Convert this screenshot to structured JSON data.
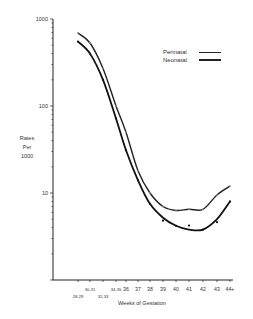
{
  "chart_data": {
    "type": "line",
    "title": "",
    "xlabel": "Weeks of Gestation",
    "ylabel": "Rates Per 1000",
    "yscale": "log",
    "ylim": [
      1,
      1000
    ],
    "yticks": [
      "1000",
      "100",
      "10"
    ],
    "categories": [
      "28-29",
      "30-31",
      "32-33",
      "34-35",
      "36",
      "37",
      "38",
      "39",
      "40",
      "41",
      "42",
      "43",
      "44+"
    ],
    "series": [
      {
        "name": "Perinatal",
        "values": [
          690,
          530,
          270,
          100,
          50,
          18,
          10,
          7,
          6.3,
          6.5,
          6.5,
          9.5,
          12
        ]
      },
      {
        "name": "Neonatal",
        "values": [
          550,
          400,
          200,
          72,
          31,
          14,
          7.5,
          5.2,
          4.2,
          3.8,
          3.8,
          5,
          8
        ]
      }
    ],
    "legend_position": "upper right",
    "grid": false
  },
  "legend": {
    "items": [
      {
        "label": "Perinatal"
      },
      {
        "label": "Neonatal"
      }
    ]
  },
  "axes": {
    "ylabel_lines": [
      "Rates",
      "Per",
      "1000"
    ],
    "xlabel": "Weeks of Gestation",
    "yticks": [
      "1000",
      "100",
      "10"
    ],
    "xticks_upper": [
      "30-31",
      "34-35",
      "36",
      "37",
      "38",
      "39",
      "40",
      "41",
      "42",
      "43",
      "44+"
    ],
    "xticks_lower": [
      "28-29",
      "32-33"
    ]
  }
}
